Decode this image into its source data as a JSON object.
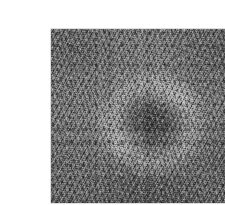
{
  "canvas": {
    "width": 225,
    "height": 205,
    "background_color": "#ffffff"
  },
  "photo": {
    "alt_text": "Close-up overhead monochrome photograph of lawn turf grass showing a fairy ring",
    "subject": "turf grass with fairy ring",
    "color_mode": "grayscale",
    "frame": {
      "left": 11,
      "top": 13,
      "width": 198,
      "height": 174,
      "border_color": "#bebebe"
    },
    "tones": {
      "base_grey": "#7a7a7a",
      "shadow_dark": "#2a2a2a",
      "highlight_light": "#d0d0d0",
      "ring_light": "#e0e0e0",
      "ring_centre_dark": "#3a3a3a"
    },
    "features": {
      "ring_center_x_pct": 50,
      "ring_center_y_pct": 52,
      "ring_radius_pct": 33,
      "bright_arc_positions": [
        "upper-right",
        "lower-left",
        "left"
      ],
      "centre_description": "darker coarse patch inside the ring"
    }
  }
}
